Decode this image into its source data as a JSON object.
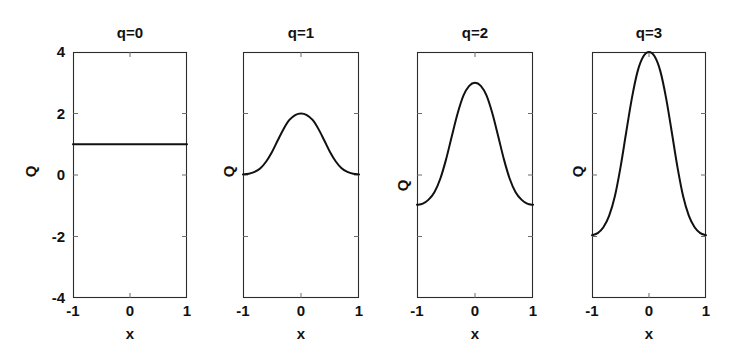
{
  "figure": {
    "background_color": "#ffffff",
    "line_color": "#111111",
    "frame_color": "#2b2b2b"
  },
  "chart_data": [
    {
      "type": "line",
      "title": "q=0",
      "xlabel": "x",
      "ylabel": "Q",
      "xlim": [
        -1,
        1
      ],
      "ylim": [
        -4,
        4
      ],
      "grid": false,
      "legend": null,
      "xticks": [
        -1,
        0,
        1
      ],
      "xticklabels": [
        "-1",
        "0",
        "1"
      ],
      "yticks": [
        -4,
        -2,
        0,
        2,
        4
      ],
      "yticklabels": [
        "-4",
        "-2",
        "0",
        "2",
        "4"
      ],
      "x": [
        -1,
        -0.9,
        -0.8,
        -0.7,
        -0.6,
        -0.5,
        -0.4,
        -0.3,
        -0.2,
        -0.1,
        0,
        0.1,
        0.2,
        0.3,
        0.4,
        0.5,
        0.6,
        0.7,
        0.8,
        0.9,
        1
      ],
      "values": [
        1,
        1,
        1,
        1,
        1,
        1,
        1,
        1,
        1,
        1,
        1,
        1,
        1,
        1,
        1,
        1,
        1,
        1,
        1,
        1,
        1
      ],
      "peak": 1,
      "baseline": 1
    },
    {
      "type": "line",
      "title": "q=1",
      "xlabel": "x",
      "ylabel": "Q",
      "xlim": [
        -1,
        1
      ],
      "ylim": [
        -4,
        4
      ],
      "grid": false,
      "legend": null,
      "xticks": [
        -1,
        0,
        1
      ],
      "xticklabels": [
        "-1",
        "0",
        "1"
      ],
      "yticks": [
        -4,
        -2,
        0,
        2,
        4
      ],
      "yticklabels": [
        "",
        "",
        "",
        "",
        ""
      ],
      "x": [
        -1,
        -0.9,
        -0.8,
        -0.7,
        -0.6,
        -0.5,
        -0.4,
        -0.3,
        -0.2,
        -0.1,
        0,
        0.1,
        0.2,
        0.3,
        0.4,
        0.5,
        0.6,
        0.7,
        0.8,
        0.9,
        1
      ],
      "values": [
        0.02,
        0.04,
        0.1,
        0.22,
        0.44,
        0.75,
        1.13,
        1.5,
        1.79,
        1.95,
        2.0,
        1.95,
        1.79,
        1.5,
        1.13,
        0.75,
        0.44,
        0.22,
        0.1,
        0.04,
        0.02
      ],
      "peak": 2,
      "baseline": 0
    },
    {
      "type": "line",
      "title": "q=2",
      "xlabel": "x",
      "ylabel": "Q",
      "xlim": [
        -1,
        1
      ],
      "ylim": [
        -4,
        4
      ],
      "grid": false,
      "legend": null,
      "xticks": [
        -1,
        0,
        1
      ],
      "xticklabels": [
        "-1",
        "0",
        "1"
      ],
      "yticks": [
        -4,
        -2,
        0,
        2,
        4
      ],
      "yticklabels": [
        "",
        "",
        "",
        "",
        ""
      ],
      "x": [
        -1,
        -0.9,
        -0.8,
        -0.7,
        -0.6,
        -0.5,
        -0.4,
        -0.3,
        -0.2,
        -0.1,
        0,
        0.1,
        0.2,
        0.3,
        0.4,
        0.5,
        0.6,
        0.7,
        0.8,
        0.9,
        1
      ],
      "values": [
        -0.97,
        -0.93,
        -0.8,
        -0.56,
        -0.13,
        0.5,
        1.26,
        2.0,
        2.58,
        2.9,
        3.0,
        2.9,
        2.58,
        2.0,
        1.26,
        0.5,
        -0.13,
        -0.56,
        -0.8,
        -0.93,
        -0.97
      ],
      "peak": 3,
      "baseline": -1
    },
    {
      "type": "line",
      "title": "q=3",
      "xlabel": "x",
      "ylabel": "Q",
      "xlim": [
        -1,
        1
      ],
      "ylim": [
        -4,
        4
      ],
      "grid": false,
      "legend": null,
      "xticks": [
        -1,
        0,
        1
      ],
      "xticklabels": [
        "-1",
        "0",
        "1"
      ],
      "yticks": [
        -4,
        -2,
        0,
        2,
        4
      ],
      "yticklabels": [
        "",
        "",
        "",
        "",
        ""
      ],
      "x": [
        -1,
        -0.9,
        -0.8,
        -0.7,
        -0.6,
        -0.5,
        -0.4,
        -0.3,
        -0.2,
        -0.1,
        0,
        0.1,
        0.2,
        0.3,
        0.4,
        0.5,
        0.6,
        0.7,
        0.8,
        0.9,
        1
      ],
      "values": [
        -1.96,
        -1.89,
        -1.7,
        -1.33,
        -0.7,
        0.25,
        1.39,
        2.5,
        3.37,
        3.85,
        4.0,
        3.85,
        3.37,
        2.5,
        1.39,
        0.25,
        -0.7,
        -1.33,
        -1.7,
        -1.89,
        -1.96
      ],
      "peak": 4,
      "baseline": -2
    }
  ],
  "panels": [
    {
      "left": 73,
      "right": 187,
      "show_yticklabels": true,
      "ylabel_x": 30,
      "ylabel_y": 172
    },
    {
      "left": 243,
      "right": 359,
      "show_yticklabels": false,
      "ylabel_x": 228,
      "ylabel_y": 172
    },
    {
      "left": 417,
      "right": 533,
      "show_yticklabels": false,
      "ylabel_x": 402,
      "ylabel_y": 186
    },
    {
      "left": 592,
      "right": 706,
      "show_yticklabels": false,
      "ylabel_x": 577,
      "ylabel_y": 172
    }
  ],
  "geometry": {
    "plot_top": 52,
    "plot_bottom": 298,
    "title_y": 24,
    "xticklabel_y": 302,
    "xlabel_y": 325
  }
}
